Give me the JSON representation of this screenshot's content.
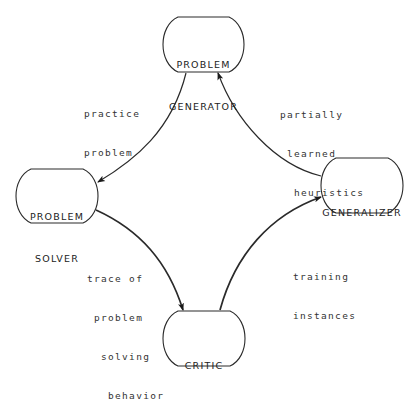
{
  "diagram": {
    "type": "cycle-flow",
    "nodes": [
      {
        "id": "problem_generator",
        "lines": [
          "PROBLEM",
          "GENERATOR"
        ]
      },
      {
        "id": "problem_solver",
        "lines": [
          "PROBLEM",
          "SOLVER"
        ]
      },
      {
        "id": "critic",
        "lines": [
          "CRITIC"
        ]
      },
      {
        "id": "generalizer",
        "lines": [
          "GENERALIZER"
        ]
      }
    ],
    "edges": [
      {
        "from": "problem_generator",
        "to": "problem_solver",
        "lines": [
          "practice",
          "problem"
        ]
      },
      {
        "from": "problem_solver",
        "to": "critic",
        "lines": [
          "trace of",
          " problem",
          "  solving",
          "   behavior"
        ]
      },
      {
        "from": "critic",
        "to": "generalizer",
        "lines": [
          "training",
          "instances"
        ]
      },
      {
        "from": "generalizer",
        "to": "problem_generator",
        "lines": [
          "partially",
          " learned",
          "  heuristics"
        ]
      }
    ]
  },
  "colors": {
    "line": "#2a2a2a",
    "text": "#222222",
    "background": "#ffffff"
  }
}
